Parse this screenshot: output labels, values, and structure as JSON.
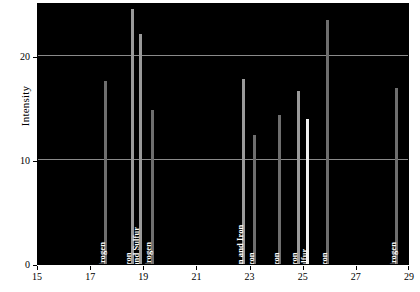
{
  "chart_data": {
    "type": "bar",
    "title": "",
    "subtitle": "",
    "xlabel": "",
    "ylabel": "Intensity",
    "xlim": [
      15,
      29
    ],
    "ylim": [
      0,
      25.2
    ],
    "xticks": [
      15,
      17,
      19,
      21,
      23,
      25,
      27,
      29
    ],
    "yticks": [
      0,
      10,
      20
    ],
    "gridlines": [
      10,
      20
    ],
    "grid": true,
    "legend": null,
    "background": "#000000",
    "peak_color": "#6e6e6e",
    "highlight_color": "#f2f2f2",
    "grid_color": "#8a8a8a",
    "axis_text_color": "#000000",
    "label_text_color": "#ffffff",
    "x": [
      17.55,
      18.55,
      18.85,
      19.3,
      22.75,
      23.15,
      24.1,
      24.8,
      25.15,
      25.9,
      28.5
    ],
    "values": [
      17.6,
      24.5,
      22.1,
      14.8,
      17.8,
      12.4,
      14.3,
      16.6,
      13.9,
      23.5,
      16.9
    ],
    "annotations": [
      "Hydrogen",
      "Iron",
      "Cobalt and Sulfur",
      "Hydrogen",
      "Hydrogen and Iron",
      "Iron",
      "Iron",
      "Iron",
      "Sulfur",
      "Iron",
      "Hydrogen"
    ],
    "peaks": [
      {
        "x": 17.55,
        "value": 17.6,
        "label": "Hydrogen",
        "style": "normal"
      },
      {
        "x": 18.55,
        "value": 24.5,
        "label": "Iron",
        "style": "mid"
      },
      {
        "x": 18.85,
        "value": 22.1,
        "label": "Cobalt and Sulfur",
        "style": "mid"
      },
      {
        "x": 19.3,
        "value": 14.8,
        "label": "Hydrogen",
        "style": "normal"
      },
      {
        "x": 22.75,
        "value": 17.8,
        "label": "Hydrogen and Iron",
        "style": "mid"
      },
      {
        "x": 23.15,
        "value": 12.4,
        "label": "Iron",
        "style": "normal"
      },
      {
        "x": 24.1,
        "value": 14.3,
        "label": "Iron",
        "style": "normal"
      },
      {
        "x": 24.8,
        "value": 16.6,
        "label": "Iron",
        "style": "mid"
      },
      {
        "x": 25.15,
        "value": 13.9,
        "label": "Sulfur",
        "style": "bright"
      },
      {
        "x": 25.9,
        "value": 23.5,
        "label": "Iron",
        "style": "normal"
      },
      {
        "x": 28.5,
        "value": 16.9,
        "label": "Hydrogen",
        "style": "normal"
      }
    ]
  },
  "axes": {
    "ylabel": "Intensity",
    "ytick_labels": [
      "0",
      "10",
      "20"
    ],
    "xtick_labels": [
      "15",
      "17",
      "19",
      "21",
      "23",
      "25",
      "27",
      "29"
    ]
  }
}
